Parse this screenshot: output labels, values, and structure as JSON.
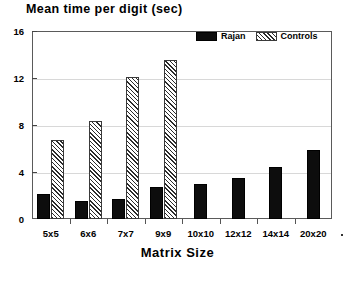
{
  "chart_data": {
    "type": "bar",
    "title": "Mean time per digit (sec)",
    "xlabel": "Matrix Size",
    "ylabel": "Mean time per digit (sec)",
    "categories": [
      "5x5",
      "6x6",
      "7x7",
      "9x9",
      "10x10",
      "12x12",
      "14x14",
      "20x20"
    ],
    "series": [
      {
        "name": "Rajan",
        "color": "#0d0d0d",
        "fill": "solid",
        "values": [
          2.1,
          1.5,
          1.7,
          2.7,
          3.0,
          3.5,
          4.4,
          5.9
        ]
      },
      {
        "name": "Controls",
        "color": "#2b2b2b",
        "fill": "diagonal-hatch",
        "values": [
          6.7,
          8.3,
          12.1,
          13.5,
          null,
          null,
          null,
          null
        ]
      }
    ],
    "ylim": [
      0,
      16
    ],
    "yticks": [
      0,
      4,
      8,
      12,
      16
    ],
    "ytick_labels": [
      "0",
      "4",
      "8",
      "12",
      "16"
    ],
    "grid": true,
    "legend_position": "top-right"
  },
  "legend": {
    "items": [
      {
        "label": "Rajan"
      },
      {
        "label": "Controls"
      }
    ]
  }
}
